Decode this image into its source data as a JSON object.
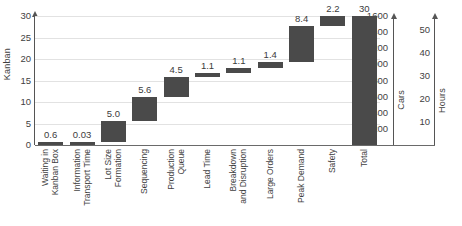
{
  "chart_data": {
    "type": "bar",
    "subtype": "waterfall",
    "title": "",
    "xlabel": "",
    "ylabel": "Kanban",
    "ylim": [
      0,
      30
    ],
    "ytick_step": 5,
    "yticks": [
      0,
      5,
      10,
      15,
      20,
      25,
      30
    ],
    "grid": true,
    "legend": false,
    "bar_color": "#4a4a4a",
    "categories": [
      "Waiting in Kanban Box",
      "Information Transport Time",
      "Lot Size Formation",
      "Sequencing",
      "Production Queue",
      "Lead Time",
      "Breakdown and Disruption",
      "Large Orders",
      "Peak Demand",
      "Safety",
      "Total"
    ],
    "category_lines": [
      [
        "Waiting in",
        "Kanban Box"
      ],
      [
        "Information",
        "Transport Time"
      ],
      [
        "Lot Size",
        "Formation"
      ],
      [
        "Sequencing"
      ],
      [
        "Production",
        "Queue"
      ],
      [
        "Lead Time"
      ],
      [
        "Breakdown",
        "and Disruption"
      ],
      [
        "Large Orders"
      ],
      [
        "Peak Demand"
      ],
      [
        "Safety"
      ],
      [
        "Total"
      ]
    ],
    "values": [
      0.6,
      0.03,
      5.0,
      5.6,
      4.5,
      1.1,
      1.1,
      1.4,
      8.4,
      2.2,
      30
    ],
    "data_labels": [
      "0.6",
      "0.03",
      "5.0",
      "5.6",
      "4.5",
      "1.1",
      "1.1",
      "1.4",
      "8.4",
      "2.2",
      "30"
    ],
    "cumulative_base": [
      0,
      0.6,
      0.63,
      5.63,
      11.23,
      15.73,
      16.83,
      17.93,
      19.33,
      27.73,
      0
    ],
    "cumulative_top": [
      0.6,
      0.63,
      5.63,
      11.23,
      15.73,
      16.83,
      17.93,
      19.33,
      27.73,
      29.93,
      30
    ],
    "is_total": [
      false,
      false,
      false,
      false,
      false,
      false,
      false,
      false,
      false,
      false,
      true
    ],
    "secondary_axes": [
      {
        "name": "Cars",
        "ticks": [
          200,
          400,
          600,
          800,
          1000,
          1200,
          1400,
          1600
        ],
        "tick_labels": [
          "200",
          "400",
          "600",
          "800",
          "1000",
          "1200",
          "1400",
          "1600"
        ],
        "lim": [
          0,
          1600
        ]
      },
      {
        "name": "Hours",
        "ticks": [
          10,
          20,
          30,
          40,
          50
        ],
        "tick_labels": [
          "10",
          "20",
          "30",
          "40",
          "50"
        ],
        "lim": [
          0,
          56
        ]
      }
    ]
  }
}
